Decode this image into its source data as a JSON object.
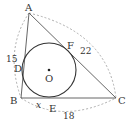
{
  "diagram": {
    "type": "triangle-with-incircle",
    "vertices": {
      "A": {
        "label": "A",
        "x": 29,
        "y": 13
      },
      "B": {
        "label": "B",
        "x": 21,
        "y": 98
      },
      "C": {
        "label": "C",
        "x": 116,
        "y": 98
      }
    },
    "incircle": {
      "center_label": "O",
      "cx": 49,
      "cy": 70,
      "r": 27
    },
    "tangent_points": {
      "D": {
        "label": "D",
        "x": 23,
        "y": 67
      },
      "E": {
        "label": "E",
        "x": 49,
        "y": 98
      },
      "F": {
        "label": "F",
        "x": 68,
        "y": 47
      }
    },
    "side_lengths": {
      "AB": "15",
      "AC": "22",
      "BC": "18"
    },
    "unknown": {
      "segment": "BE",
      "label": "x"
    },
    "colors": {
      "lines": "#444444",
      "dashed": "#999999",
      "text": "#333333"
    }
  }
}
